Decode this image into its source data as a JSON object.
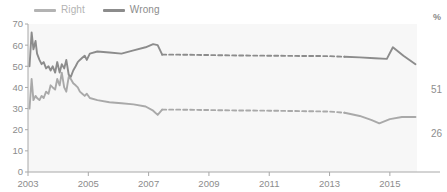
{
  "chart_data": {
    "type": "line",
    "title": "",
    "subtitle": "",
    "xlabel": "",
    "ylabel": "",
    "unit_label": "%",
    "xlim": [
      2003.0,
      2015.9
    ],
    "ylim": [
      0,
      70
    ],
    "yticks": [
      0,
      10,
      20,
      30,
      40,
      50,
      60,
      70
    ],
    "xticks": [
      2003,
      2005,
      2007,
      2009,
      2011,
      2013,
      2015
    ],
    "grid": false,
    "legend_position": "top-left",
    "series": [
      {
        "name": "Right",
        "color": "#a9a9a9",
        "end_value": 26,
        "end_label": "26",
        "x": [
          2003.05,
          2003.12,
          2003.18,
          2003.25,
          2003.3,
          2003.38,
          2003.45,
          2003.52,
          2003.6,
          2003.68,
          2003.75,
          2003.82,
          2003.9,
          2003.97,
          2004.05,
          2004.12,
          2004.2,
          2004.27,
          2004.35,
          2004.42,
          2004.5,
          2004.58,
          2004.65,
          2004.72,
          2004.8,
          2004.88,
          2004.95,
          2005.05,
          2005.3,
          2005.7,
          2006.1,
          2006.5,
          2006.9,
          2007.15,
          2007.3,
          2007.45,
          2008.0,
          2009.0,
          2010.0,
          2011.0,
          2012.0,
          2013.0,
          2013.5,
          2014.0,
          2014.4,
          2014.65,
          2015.0,
          2015.4,
          2015.85
        ],
        "y": [
          30,
          44,
          34,
          36,
          35,
          34,
          36,
          35,
          38,
          37,
          41,
          40,
          39,
          44,
          41,
          47,
          40,
          38,
          45,
          44,
          42,
          41,
          40,
          38,
          37,
          36,
          37,
          35,
          34,
          33,
          32.5,
          32,
          31,
          29,
          27,
          29.5,
          29.5,
          29.3,
          29.1,
          29,
          28.8,
          28.6,
          28,
          26.5,
          24.5,
          23,
          25,
          26,
          26
        ],
        "dashed_from": 2007.45,
        "dashed_to": 2013.0
      },
      {
        "name": "Wrong",
        "color": "#8c8c8c",
        "end_value": 51,
        "end_label": "51",
        "x": [
          2003.05,
          2003.12,
          2003.18,
          2003.25,
          2003.3,
          2003.38,
          2003.45,
          2003.52,
          2003.6,
          2003.68,
          2003.75,
          2003.82,
          2003.9,
          2003.97,
          2004.05,
          2004.12,
          2004.2,
          2004.27,
          2004.35,
          2004.42,
          2004.5,
          2004.58,
          2004.65,
          2004.72,
          2004.8,
          2004.88,
          2004.95,
          2005.05,
          2005.3,
          2005.7,
          2006.1,
          2006.5,
          2006.9,
          2007.15,
          2007.3,
          2007.45,
          2008.0,
          2009.0,
          2010.0,
          2011.0,
          2012.0,
          2013.0,
          2013.5,
          2014.0,
          2014.5,
          2014.9,
          2015.1,
          2015.45,
          2015.85
        ],
        "y": [
          50,
          66,
          58,
          62,
          56,
          53,
          51,
          52,
          49,
          50,
          48,
          50,
          47,
          52,
          47,
          51,
          49,
          53,
          46,
          45,
          48,
          50,
          52,
          53,
          54,
          55,
          53,
          56,
          57,
          56.5,
          56,
          57.5,
          59,
          60.5,
          60,
          55.5,
          55.5,
          55.3,
          55.1,
          55,
          54.9,
          54.8,
          54.5,
          54.2,
          53.8,
          53.5,
          59,
          55,
          51
        ],
        "dashed_from": 2007.45,
        "dashed_to": 2013.0
      }
    ]
  },
  "legend": {
    "items": [
      {
        "label": "Right",
        "color": "#b3b3b3"
      },
      {
        "label": "Wrong",
        "color": "#8c8c8c"
      }
    ]
  },
  "axis": {
    "y_labels": [
      "70",
      "60",
      "50",
      "40",
      "30",
      "20",
      "10",
      "0"
    ],
    "x_labels": [
      "2003",
      "2005",
      "2007",
      "2009",
      "2011",
      "2013",
      "2015"
    ]
  },
  "annotations": {
    "unit": "%",
    "end_wrong": "51",
    "end_right": "26"
  }
}
